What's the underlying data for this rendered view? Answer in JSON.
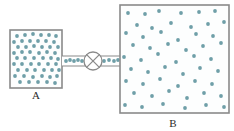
{
  "figure": {
    "type": "physics-schematic",
    "canvas": {
      "width": 234,
      "height": 131,
      "background": "#ffffff"
    }
  },
  "colors": {
    "particle": "#6f9fa8",
    "particle_alt": "#7fb0b5",
    "border": "#8a8a8a",
    "chamber_fill": "#fdfefe",
    "label_text": "#2b2b2b",
    "page_background": "#ffffff"
  },
  "chambers": [
    {
      "id": "A",
      "label": "A",
      "label_x": 36,
      "label_y": 99,
      "x": 10,
      "y": 30,
      "width": 52,
      "height": 58,
      "particle_count": 48,
      "density": "high",
      "description": "Left chamber densely filled with gas particles"
    },
    {
      "id": "B",
      "label": "B",
      "label_x": 173,
      "label_y": 127,
      "x": 120,
      "y": 5,
      "width": 109,
      "height": 108,
      "particle_count": 52,
      "density": "low",
      "description": "Right chamber sparsely filled with gas particles"
    }
  ],
  "connector": {
    "name": "tube",
    "x": 62,
    "y": 56,
    "width": 58,
    "height": 10,
    "top_line_y": 56,
    "bottom_line_y": 66,
    "particle_count": 9
  },
  "valve": {
    "name": "valve",
    "cx": 93,
    "cy": 61,
    "r": 9,
    "symbol": "circle-with-x",
    "state": "closed"
  },
  "particles": {
    "radius": 1.9,
    "chamber_a": [
      [
        17,
        36
      ],
      [
        25,
        35
      ],
      [
        33,
        34
      ],
      [
        41,
        35
      ],
      [
        49,
        35
      ],
      [
        56,
        36
      ],
      [
        14,
        42
      ],
      [
        22,
        41
      ],
      [
        30,
        41
      ],
      [
        38,
        41
      ],
      [
        46,
        41
      ],
      [
        54,
        42
      ],
      [
        18,
        47
      ],
      [
        26,
        47
      ],
      [
        34,
        46
      ],
      [
        42,
        47
      ],
      [
        50,
        47
      ],
      [
        58,
        47
      ],
      [
        14,
        53
      ],
      [
        22,
        52
      ],
      [
        30,
        52
      ],
      [
        39,
        53
      ],
      [
        47,
        52
      ],
      [
        55,
        53
      ],
      [
        17,
        58
      ],
      [
        25,
        58
      ],
      [
        34,
        58
      ],
      [
        43,
        58
      ],
      [
        51,
        58
      ],
      [
        58,
        59
      ],
      [
        14,
        64
      ],
      [
        22,
        64
      ],
      [
        31,
        64
      ],
      [
        39,
        64
      ],
      [
        48,
        64
      ],
      [
        56,
        64
      ],
      [
        18,
        70
      ],
      [
        27,
        70
      ],
      [
        35,
        70
      ],
      [
        44,
        70
      ],
      [
        52,
        70
      ],
      [
        59,
        70
      ],
      [
        15,
        76
      ],
      [
        24,
        76
      ],
      [
        33,
        77
      ],
      [
        42,
        76
      ],
      [
        50,
        77
      ],
      [
        57,
        76
      ],
      [
        20,
        82
      ],
      [
        29,
        82
      ],
      [
        38,
        82
      ],
      [
        47,
        82
      ],
      [
        55,
        83
      ]
    ],
    "chamber_b": [
      [
        128,
        13
      ],
      [
        145,
        14
      ],
      [
        159,
        11
      ],
      [
        181,
        13
      ],
      [
        199,
        12
      ],
      [
        215,
        11
      ],
      [
        137,
        25
      ],
      [
        152,
        28
      ],
      [
        171,
        23
      ],
      [
        191,
        27
      ],
      [
        208,
        24
      ],
      [
        224,
        22
      ],
      [
        126,
        33
      ],
      [
        143,
        37
      ],
      [
        161,
        32
      ],
      [
        178,
        40
      ],
      [
        196,
        34
      ],
      [
        213,
        36
      ],
      [
        133,
        45
      ],
      [
        150,
        48
      ],
      [
        168,
        44
      ],
      [
        186,
        50
      ],
      [
        203,
        46
      ],
      [
        221,
        43
      ],
      [
        124,
        57
      ],
      [
        141,
        60
      ],
      [
        158,
        54
      ],
      [
        176,
        62
      ],
      [
        194,
        56
      ],
      [
        211,
        59
      ],
      [
        228,
        52
      ],
      [
        131,
        69
      ],
      [
        148,
        72
      ],
      [
        165,
        67
      ],
      [
        183,
        74
      ],
      [
        200,
        68
      ],
      [
        218,
        71
      ],
      [
        126,
        81
      ],
      [
        143,
        84
      ],
      [
        160,
        79
      ],
      [
        178,
        86
      ],
      [
        195,
        81
      ],
      [
        212,
        84
      ],
      [
        228,
        78
      ],
      [
        134,
        93
      ],
      [
        152,
        96
      ],
      [
        169,
        91
      ],
      [
        187,
        98
      ],
      [
        204,
        93
      ],
      [
        221,
        96
      ],
      [
        125,
        105
      ],
      [
        142,
        107
      ],
      [
        163,
        104
      ],
      [
        185,
        108
      ],
      [
        206,
        105
      ],
      [
        224,
        107
      ]
    ],
    "tube": [
      [
        66,
        61
      ],
      [
        70,
        60
      ],
      [
        74,
        61
      ],
      [
        78,
        60
      ],
      [
        82,
        61
      ],
      [
        104,
        61
      ],
      [
        109,
        60
      ],
      [
        114,
        61
      ],
      [
        118,
        60
      ]
    ]
  }
}
